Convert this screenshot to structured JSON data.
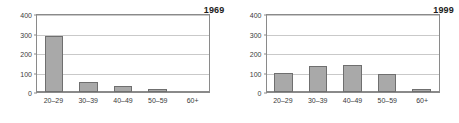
{
  "chart_data": [
    {
      "type": "bar",
      "title": "1969",
      "xlabel": "",
      "ylabel": "",
      "categories": [
        "20–29",
        "30–39",
        "40–49",
        "50–59",
        "60+"
      ],
      "values": [
        290,
        50,
        30,
        15,
        0
      ],
      "ylim": [
        0,
        400
      ],
      "yticks": [
        0,
        100,
        200,
        300,
        400
      ],
      "grid": true,
      "legend": "none",
      "bar_color": "#a9a9a9",
      "bar_edge_color": "#6f6f6f"
    },
    {
      "type": "bar",
      "title": "1999",
      "xlabel": "",
      "ylabel": "",
      "categories": [
        "20–29",
        "30–39",
        "40–49",
        "50–59",
        "60+"
      ],
      "values": [
        100,
        135,
        140,
        95,
        15
      ],
      "ylim": [
        0,
        400
      ],
      "yticks": [
        0,
        100,
        200,
        300,
        400
      ],
      "grid": true,
      "legend": "none",
      "bar_color": "#a9a9a9",
      "bar_edge_color": "#6f6f6f"
    }
  ],
  "panels": [
    {
      "year_label": "1969",
      "yticks": [
        "400",
        "300",
        "200",
        "100",
        "0"
      ],
      "categories": [
        "20–29",
        "30–39",
        "40–49",
        "50–59",
        "60+"
      ]
    },
    {
      "year_label": "1999",
      "yticks": [
        "400",
        "300",
        "200",
        "100",
        "0"
      ],
      "categories": [
        "20–29",
        "30–39",
        "40–49",
        "50–59",
        "60+"
      ]
    }
  ]
}
